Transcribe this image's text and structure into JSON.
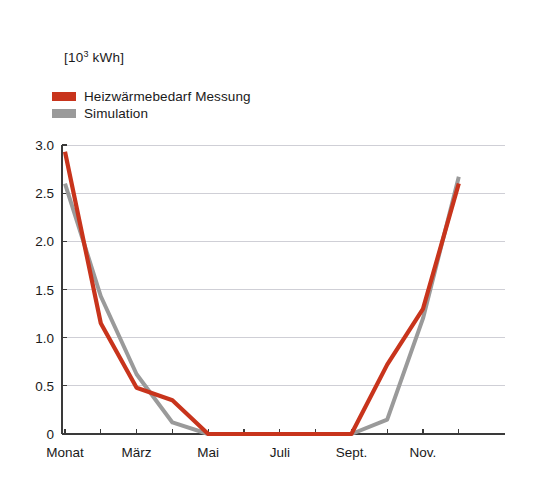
{
  "axis_unit_label": "[10 kWh]",
  "axis_unit_base": "[10",
  "axis_unit_exponent": "3",
  "axis_unit_suffix": " kWh]",
  "legend": {
    "position": "top-left",
    "items": [
      {
        "label": "Heizwärmebedarf Messung",
        "color": "#c8341c",
        "name": "measurement"
      },
      {
        "label": "Simulation",
        "color": "#9a9a9a",
        "name": "simulation"
      }
    ]
  },
  "colors": {
    "measurement": "#c8341c",
    "simulation": "#9a9a9a",
    "axis": "#3a3a3a",
    "grid": "#cfcfd6",
    "background": "#ffffff"
  },
  "chart_data": {
    "type": "line",
    "title": "",
    "subtitle": "",
    "xlabel": "",
    "ylabel": "[10³ kWh]",
    "ylim": [
      0,
      3.0
    ],
    "yticks": [
      0,
      0.5,
      1.0,
      1.5,
      2.0,
      2.5,
      3.0
    ],
    "ytick_labels": [
      "0",
      "0.5",
      "1.0",
      "1.5",
      "2.0",
      "2.5",
      "3.0"
    ],
    "grid": true,
    "grid_axis": "y",
    "legend_position": "top-left",
    "x": [
      1,
      2,
      3,
      4,
      5,
      6,
      7,
      8,
      9,
      10,
      11,
      12
    ],
    "categories": [
      "Monat",
      "",
      "März",
      "",
      "Mai",
      "",
      "Juli",
      "",
      "Sept.",
      "",
      "Nov.",
      ""
    ],
    "xtick_labels": [
      "Monat",
      "März",
      "Mai",
      "Juli",
      "Sept.",
      "Nov."
    ],
    "xtick_positions": [
      1,
      3,
      5,
      7,
      9,
      11
    ],
    "series": [
      {
        "name": "Heizwärmebedarf Messung",
        "color": "#c8341c",
        "values": [
          2.93,
          1.15,
          0.48,
          0.35,
          0.0,
          0.0,
          0.0,
          0.0,
          0.0,
          0.72,
          1.3,
          2.6
        ]
      },
      {
        "name": "Simulation",
        "color": "#9a9a9a",
        "values": [
          2.6,
          1.43,
          0.62,
          0.12,
          0.0,
          0.0,
          0.0,
          0.0,
          0.0,
          0.15,
          1.2,
          2.67
        ]
      }
    ]
  },
  "plot_geometry": {
    "left": 62,
    "right": 505,
    "top": 145,
    "bottom": 434,
    "x_step": 35.8,
    "x_first": 65
  }
}
